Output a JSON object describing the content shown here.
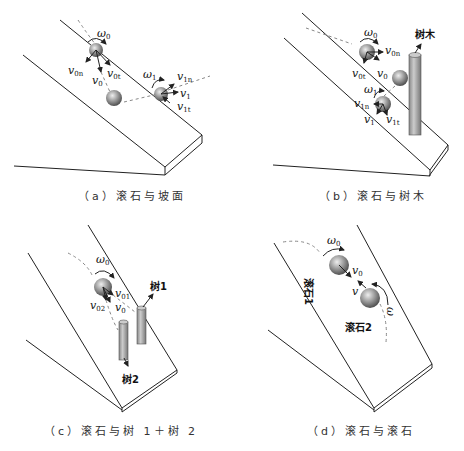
{
  "figure": {
    "panels": [
      {
        "id": "a",
        "caption": "（a）滚石与坡面",
        "labels": {
          "omega0": "ω",
          "omega0_sub": "0",
          "v0": "v",
          "v0_sub": "0",
          "v0n": "v",
          "v0n_sub": "0n",
          "v0t": "v",
          "v0t_sub": "0t",
          "omega1": "ω",
          "omega1_sub": "1",
          "v1": "v",
          "v1_sub": "1",
          "v1n": "v",
          "v1n_sub": "1n",
          "v1t": "v",
          "v1t_sub": "1t"
        }
      },
      {
        "id": "b",
        "caption": "（b）滚石与树木",
        "labels": {
          "tree": "树木",
          "omega0": "ω",
          "omega0_sub": "0",
          "v0": "v",
          "v0_sub": "0",
          "v0n": "v",
          "v0n_sub": "0n",
          "v0t": "v",
          "v0t_sub": "0t",
          "omega1": "ω",
          "omega1_sub": "1",
          "v1": "v",
          "v1_sub": "1",
          "v1n": "v",
          "v1n_sub": "1n",
          "v1t": "v",
          "v1t_sub": "1t"
        }
      },
      {
        "id": "c",
        "caption": "（c）滚石与树 1＋树 2",
        "labels": {
          "tree1": "树1",
          "tree2": "树2",
          "omega0": "ω",
          "omega0_sub": "0",
          "v0": "v",
          "v0_sub": "0",
          "v01": "v",
          "v01_sub": "01",
          "v02": "v",
          "v02_sub": "02"
        }
      },
      {
        "id": "d",
        "caption": "（d）滚石与滚石",
        "labels": {
          "rock1": "滚石1",
          "rock2": "滚石2",
          "omega0": "ω",
          "omega0_sub": "0",
          "v0": "v",
          "v0_sub": "0",
          "v": "v",
          "omega": "ω"
        }
      }
    ]
  }
}
